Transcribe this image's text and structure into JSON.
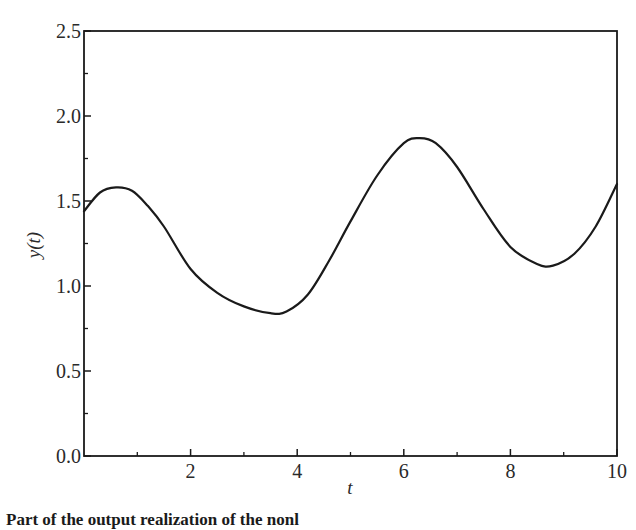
{
  "chart_data": {
    "type": "line",
    "title": "",
    "xlabel": "t",
    "ylabel": "y(t)",
    "xlim": [
      0,
      10
    ],
    "ylim": [
      0.0,
      2.5
    ],
    "grid": false,
    "legend": null,
    "x_ticks": [
      2,
      4,
      6,
      8,
      10
    ],
    "x_tick_labels": [
      "2",
      "4",
      "6",
      "8",
      "10"
    ],
    "x_minor_ticks": [
      1,
      3,
      5,
      7,
      9
    ],
    "y_ticks": [
      0.0,
      0.5,
      1.0,
      1.5,
      2.0,
      2.5
    ],
    "y_tick_labels": [
      "0.0",
      "0.5",
      "1.0",
      "1.5",
      "2.0",
      "2.5"
    ],
    "y_minor_ticks": [
      0.25,
      0.75,
      1.25,
      1.75,
      2.25
    ],
    "series": [
      {
        "name": "y(t)",
        "color": "#1a1a1a",
        "x": [
          0,
          0.3,
          0.6,
          0.9,
          1.2,
          1.5,
          2.0,
          2.5,
          3.0,
          3.5,
          3.8,
          4.2,
          4.6,
          5.0,
          5.5,
          6.0,
          6.3,
          6.6,
          7.0,
          7.5,
          8.0,
          8.5,
          8.8,
          9.2,
          9.6,
          10.0
        ],
        "values": [
          1.44,
          1.55,
          1.58,
          1.56,
          1.47,
          1.35,
          1.1,
          0.96,
          0.88,
          0.84,
          0.85,
          0.95,
          1.15,
          1.38,
          1.65,
          1.84,
          1.87,
          1.84,
          1.7,
          1.45,
          1.23,
          1.13,
          1.12,
          1.19,
          1.35,
          1.6
        ]
      }
    ]
  },
  "caption": "Part of the output realization of the nonl"
}
